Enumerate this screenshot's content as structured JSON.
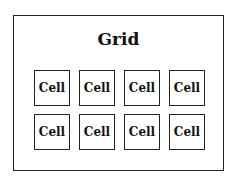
{
  "diagram": {
    "title": "Grid",
    "cells": [
      "Cell",
      "Cell",
      "Cell",
      "Cell",
      "Cell",
      "Cell",
      "Cell",
      "Cell"
    ],
    "layout": {
      "rows": 2,
      "columns": 4
    },
    "colors": {
      "border": "#222222",
      "background": "#ffffff",
      "text": "#111111"
    }
  }
}
